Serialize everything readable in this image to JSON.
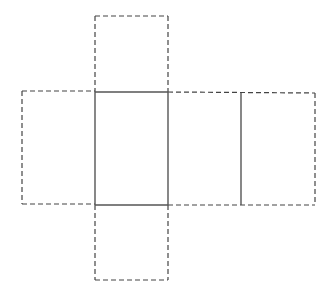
{
  "diagram": {
    "type": "net-of-rectangular-prism",
    "stroke_colors": {
      "solid": "#555555",
      "dashed": "#444444"
    },
    "background": "#ffffff",
    "segments": {
      "solid": [
        {
          "name": "center-top-edge",
          "x1": 95,
          "y1": 92,
          "x2": 168,
          "y2": 92
        },
        {
          "name": "center-bottom-edge",
          "x1": 95,
          "y1": 205,
          "x2": 168,
          "y2": 205
        },
        {
          "name": "center-left-edge",
          "x1": 95,
          "y1": 92,
          "x2": 95,
          "y2": 205
        },
        {
          "name": "center-right-edge",
          "x1": 168,
          "y1": 92,
          "x2": 168,
          "y2": 205
        },
        {
          "name": "right-fold-line",
          "x1": 241,
          "y1": 93,
          "x2": 241,
          "y2": 205
        }
      ],
      "dashed": [
        {
          "name": "top-flap-left",
          "x1": 95,
          "y1": 16,
          "x2": 95,
          "y2": 92
        },
        {
          "name": "top-flap-top",
          "x1": 95,
          "y1": 16,
          "x2": 168,
          "y2": 16
        },
        {
          "name": "top-flap-right",
          "x1": 168,
          "y1": 16,
          "x2": 168,
          "y2": 92
        },
        {
          "name": "left-flap-top",
          "x1": 22,
          "y1": 91,
          "x2": 95,
          "y2": 91
        },
        {
          "name": "left-flap-left",
          "x1": 22,
          "y1": 91,
          "x2": 22,
          "y2": 204
        },
        {
          "name": "left-flap-bottom",
          "x1": 22,
          "y1": 204,
          "x2": 95,
          "y2": 204
        },
        {
          "name": "bottom-flap-left",
          "x1": 95,
          "y1": 205,
          "x2": 95,
          "y2": 280
        },
        {
          "name": "bottom-flap-bottom",
          "x1": 95,
          "y1": 280,
          "x2": 168,
          "y2": 280
        },
        {
          "name": "bottom-flap-right",
          "x1": 168,
          "y1": 205,
          "x2": 168,
          "y2": 280
        },
        {
          "name": "right-strip-top",
          "x1": 168,
          "y1": 92,
          "x2": 315,
          "y2": 93
        },
        {
          "name": "right-strip-bottom",
          "x1": 168,
          "y1": 205,
          "x2": 315,
          "y2": 205
        },
        {
          "name": "right-strip-end",
          "x1": 315,
          "y1": 93,
          "x2": 315,
          "y2": 205
        }
      ]
    }
  }
}
